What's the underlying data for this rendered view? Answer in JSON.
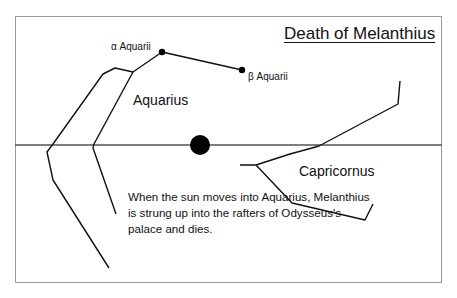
{
  "title": "Death of Melanthius",
  "stars": {
    "alpha": {
      "label": "α Aquarii"
    },
    "beta": {
      "label": "β Aquarii"
    }
  },
  "constellations": {
    "aquarius": {
      "label": "Aquarius"
    },
    "capricornus": {
      "label": "Capricornus"
    }
  },
  "sun": {
    "label": "sun",
    "color": "#000000"
  },
  "caption": "When the sun moves into Aquarius, Melanthius is strung up into the rafters of Odysseus's palace and dies.",
  "colors": {
    "line": "#111111",
    "frame": "#9a9a9a",
    "horizon": "#555555"
  }
}
